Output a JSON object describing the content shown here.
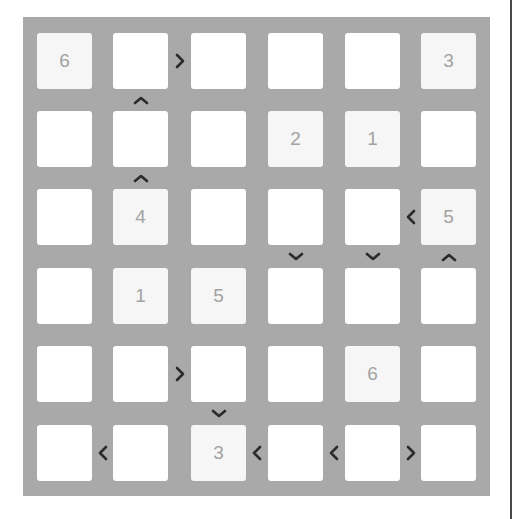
{
  "puzzle": {
    "type": "futoshiki",
    "size": 6,
    "colors": {
      "board_background": "#a9a9a9",
      "cell_empty": "#ffffff",
      "cell_given": "#f6f6f6",
      "digit": "#a2a2a2",
      "symbol": "#2b2b2b"
    },
    "grid": [
      [
        "6",
        "",
        "",
        "",
        "",
        "3"
      ],
      [
        "",
        "",
        "",
        "2",
        "1",
        ""
      ],
      [
        "",
        "4",
        "",
        "",
        "",
        "5"
      ],
      [
        "",
        "1",
        "5",
        "",
        "",
        ""
      ],
      [
        "",
        "",
        "",
        "",
        "6",
        ""
      ],
      [
        "",
        "",
        "3",
        "",
        "",
        ""
      ]
    ],
    "horizontal_constraints": [
      {
        "row": 0,
        "col": 1,
        "symbol": ">",
        "icon": "greater-than-icon"
      },
      {
        "row": 2,
        "col": 4,
        "symbol": "<",
        "icon": "less-than-icon"
      },
      {
        "row": 4,
        "col": 1,
        "symbol": ">",
        "icon": "greater-than-icon"
      },
      {
        "row": 5,
        "col": 0,
        "symbol": "<",
        "icon": "less-than-icon"
      },
      {
        "row": 5,
        "col": 2,
        "symbol": "<",
        "icon": "less-than-icon"
      },
      {
        "row": 5,
        "col": 3,
        "symbol": "<",
        "icon": "less-than-icon"
      },
      {
        "row": 5,
        "col": 4,
        "symbol": ">",
        "icon": "greater-than-icon"
      }
    ],
    "vertical_constraints": [
      {
        "row": 0,
        "col": 1,
        "symbol": "^",
        "meaning": "top < bottom",
        "icon": "up-chevron-icon"
      },
      {
        "row": 1,
        "col": 1,
        "symbol": "^",
        "meaning": "top < bottom",
        "icon": "up-chevron-icon"
      },
      {
        "row": 2,
        "col": 3,
        "symbol": "v",
        "meaning": "top > bottom",
        "icon": "down-chevron-icon"
      },
      {
        "row": 2,
        "col": 4,
        "symbol": "v",
        "meaning": "top > bottom",
        "icon": "down-chevron-icon"
      },
      {
        "row": 2,
        "col": 5,
        "symbol": "^",
        "meaning": "top < bottom",
        "icon": "up-chevron-icon"
      },
      {
        "row": 4,
        "col": 2,
        "symbol": "v",
        "meaning": "top > bottom",
        "icon": "down-chevron-icon"
      }
    ]
  }
}
